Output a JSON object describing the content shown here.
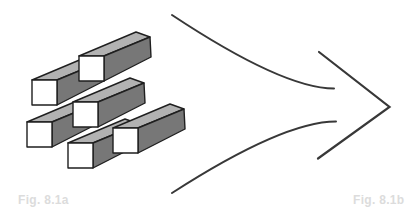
{
  "figure": {
    "left_panel": {
      "label": "Fig. 8.1a",
      "bar_count": 6
    },
    "right_panel": {
      "label": "Fig. 8.1b",
      "streamline_count": 2
    }
  },
  "labels": {
    "fig_a": "Fig. 8.1a",
    "fig_b": "Fig. 8.1b"
  },
  "colors": {
    "background": "#ffffff",
    "bar_front": "#ffffff",
    "bar_top": "#b2b2b2",
    "bar_side": "#777777",
    "bar_outline": "#1f1f1f",
    "arrow_line": "#383838",
    "label_text": "#dcdcdc"
  }
}
